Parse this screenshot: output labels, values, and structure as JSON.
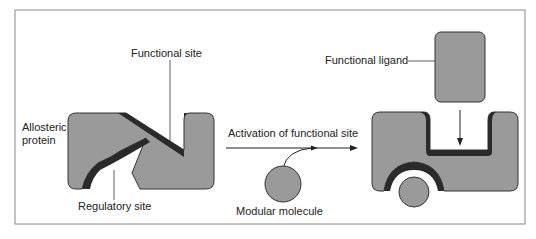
{
  "labels": {
    "allosteric_line1": "Allosteric",
    "allosteric_line2": "protein",
    "functional_site": "Functional site",
    "regulatory_site": "Regulatory site",
    "activation": "Activation of functional site",
    "modular_molecule": "Modular molecule",
    "functional_ligand": "Functional ligand"
  },
  "colors": {
    "protein_fill": "#9a9a9a",
    "site_dark": "#2a2a2a",
    "frame": "#777777",
    "line": "#333333"
  }
}
